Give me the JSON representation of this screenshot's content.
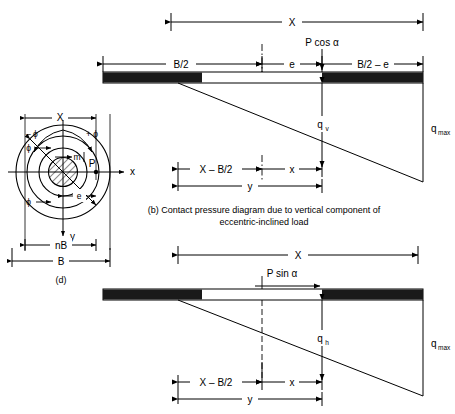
{
  "figure": {
    "title_b": "(b) Contact pressure diagram due to vertical component of",
    "title_b2": "eccentric-inclined load",
    "panel_d_label": "(d)"
  },
  "panel_b": {
    "name": "contact-pressure-vertical",
    "dim_X": "X",
    "dim_B_half": "B/2",
    "dim_e": "e",
    "dim_B_half_minus_e": "B/2 – e",
    "load_label": "P cos α",
    "pressure_mid": "q",
    "pressure_mid_sub": "v",
    "pressure_max": "q",
    "pressure_max_sub": "max",
    "dim_X_minus_B2": "X – B/2",
    "dim_x": "x",
    "dim_y": "y"
  },
  "panel_c": {
    "name": "contact-pressure-horizontal",
    "dim_X": "X",
    "load_label": "P sin α",
    "pressure_mid": "q",
    "pressure_mid_sub": "h",
    "pressure_max": "q",
    "pressure_max_sub": "max",
    "dim_X_minus_B2": "X – B/2",
    "dim_x": "x",
    "dim_y": "y"
  },
  "panel_d": {
    "name": "circular-footing-plan",
    "dim_X": "X",
    "dim_B": "B",
    "dim_nB": "nB",
    "dim_e": "e",
    "axis_x": "x",
    "axis_y": "y",
    "label_m": "m",
    "label_P": "P",
    "label_phi_plus": "+ ϕ",
    "label_phi_minus": "– ϕ",
    "label_phi_1": "ϕ",
    "label_phi_2": "ϕ"
  },
  "colors": {
    "line": "#000000",
    "fill_dark": "#1a1a1a",
    "fill_white": "#ffffff",
    "background": "#ffffff"
  }
}
